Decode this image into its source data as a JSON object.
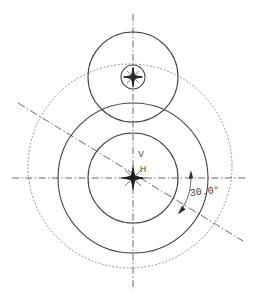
{
  "drawing": {
    "title": "Circular Feature Layout with Angular Dimension",
    "background_color": "#ffffff",
    "line_color": "#3f3f3f",
    "construction_color": "#8a8a8a",
    "centerline_color": "#585858",
    "text_color": "#3a3a3a",
    "canvas": {
      "width": 258,
      "height": 305
    },
    "labels": {
      "vertical_axis": "V",
      "horizontal_axis": "H",
      "angle_dimension": "30.0°"
    },
    "geometry": {
      "main_center": {
        "x": 133,
        "y": 178
      },
      "upper_center": {
        "x": 133,
        "y": 77
      },
      "construction_center": {
        "x": 130,
        "y": 166
      },
      "circles": [
        {
          "name": "upper-outer-circle",
          "cx": 133,
          "cy": 77,
          "r": 45,
          "style": "solid"
        },
        {
          "name": "upper-hub-circle",
          "cx": 133,
          "cy": 77,
          "r": 12,
          "style": "solid"
        },
        {
          "name": "main-outer-circle",
          "cx": 133,
          "cy": 178,
          "r": 75,
          "style": "solid"
        },
        {
          "name": "main-inner-circle",
          "cx": 133,
          "cy": 178,
          "r": 45,
          "style": "solid"
        },
        {
          "name": "construction-circle",
          "cx": 130,
          "cy": 166,
          "r": 102,
          "style": "dotted"
        }
      ],
      "centerlines": [
        {
          "name": "horizontal-centerline",
          "x1": 12,
          "y1": 178,
          "x2": 246,
          "y2": 178
        },
        {
          "name": "vertical-centerline",
          "x1": 133,
          "y1": 14,
          "x2": 133,
          "y2": 290
        }
      ],
      "angle_line": {
        "x1": 18,
        "y1": 103,
        "x2": 243,
        "y2": 241,
        "angle_deg": 30.0
      },
      "angle_arc": {
        "cx": 133,
        "cy": 178,
        "r": 58,
        "start_deg": 0,
        "end_deg": 30
      }
    }
  }
}
